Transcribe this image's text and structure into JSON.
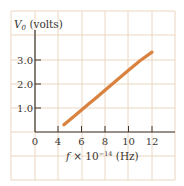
{
  "chart_data": {
    "type": "line",
    "title": "",
    "xlabel": "f × 10^-14 (Hz)",
    "xlabel_parts": {
      "var": "f",
      "times": " × 10",
      "exp": "−14",
      "unit": " (Hz)"
    },
    "ylabel": "V0 (volts)",
    "ylabel_parts": {
      "var": "V",
      "sub": "0",
      "unit": " (volts)"
    },
    "x_ticks": [
      "0",
      "4",
      "6",
      "8",
      "10",
      "12"
    ],
    "y_ticks": [
      "1.0",
      "2.0",
      "3.0"
    ],
    "xlim": [
      0,
      14
    ],
    "ylim": [
      0,
      4
    ],
    "x_axis_break": "0 to 4 compressed into one grid cell",
    "grid": true,
    "series": [
      {
        "name": "Stopping potential vs frequency",
        "x": [
          4.5,
          5.5,
          6.5,
          7.3,
          8.2,
          9.1,
          10.0,
          11.0,
          12.0
        ],
        "y": [
          0.3,
          0.71,
          1.12,
          1.45,
          1.82,
          2.2,
          2.57,
          2.98,
          3.33
        ]
      }
    ],
    "colors": {
      "line": "#D9823F",
      "grid": "#EAD6C0",
      "axis": "#3a3530",
      "text": "#3a3530"
    }
  }
}
